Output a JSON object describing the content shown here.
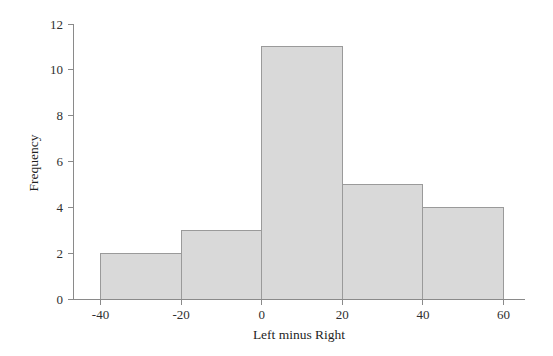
{
  "chart_data": {
    "type": "bar",
    "title": "",
    "subtitle": "",
    "xlabel": "Left minus Right",
    "ylabel": "Frequency",
    "categories": [
      "-40 to -20",
      "-20 to 0",
      "0 to 20",
      "20 to 40",
      "40 to 60"
    ],
    "bin_edges": [
      -40,
      -20,
      0,
      20,
      40,
      60
    ],
    "values": [
      2,
      3,
      11,
      5,
      4
    ],
    "xlim": [
      -40,
      60
    ],
    "ylim": [
      0,
      12
    ],
    "xticks": [
      -40,
      -20,
      0,
      20,
      40,
      60
    ],
    "xtick_labels": [
      "-40",
      "-20",
      "0",
      "20",
      "40",
      "60"
    ],
    "yticks": [
      0,
      2,
      4,
      6,
      8,
      10,
      12
    ],
    "ytick_labels": [
      "0",
      "2",
      "4",
      "6",
      "8",
      "10",
      "12"
    ],
    "grid": false,
    "legend": null,
    "bar_fill_color": "#d9d9d9",
    "bar_edge_color": "#9a9a9a",
    "axis_color": "#8a8a8a",
    "text_color": "#2b2b2b",
    "background_color": "#ffffff"
  },
  "axes": {
    "y_title": "Frequency",
    "x_title": "Left minus Right"
  },
  "y_ticks": [
    {
      "label": "12",
      "value": 12
    },
    {
      "label": "10",
      "value": 10
    },
    {
      "label": "8",
      "value": 8
    },
    {
      "label": "6",
      "value": 6
    },
    {
      "label": "4",
      "value": 4
    },
    {
      "label": "2",
      "value": 2
    },
    {
      "label": "0",
      "value": 0
    }
  ],
  "x_ticks": [
    {
      "label": "-40",
      "value": -40
    },
    {
      "label": "-20",
      "value": -20
    },
    {
      "label": "0",
      "value": 0
    },
    {
      "label": "20",
      "value": 20
    },
    {
      "label": "40",
      "value": 40
    },
    {
      "label": "60",
      "value": 60
    }
  ],
  "bars": [
    {
      "label": "-40 to -20",
      "value": 2
    },
    {
      "label": "-20 to 0",
      "value": 3
    },
    {
      "label": "0 to 20",
      "value": 11
    },
    {
      "label": "20 to 40",
      "value": 5
    },
    {
      "label": "40 to 60",
      "value": 4
    }
  ]
}
